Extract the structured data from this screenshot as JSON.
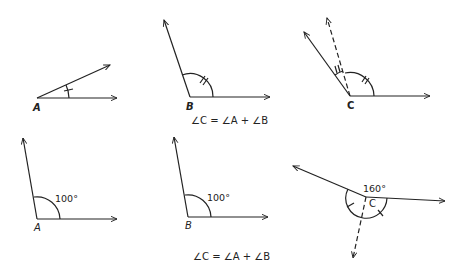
{
  "figure": {
    "top_row": {
      "angle_a": {
        "vertex_label": "A",
        "marks": "single-tick"
      },
      "angle_b": {
        "vertex_label": "B",
        "marks": "double-tick"
      },
      "angle_c": {
        "vertex_label": "C",
        "marks": "single-and-double-tick",
        "construction": "dashed ray"
      },
      "equation": "∠C = ∠A + ∠B"
    },
    "bottom_row": {
      "angle_a": {
        "vertex_label": "A",
        "measure": "100°"
      },
      "angle_b": {
        "vertex_label": "B",
        "measure": "100°"
      },
      "angle_c": {
        "vertex_label": "C",
        "measure": "160°",
        "construction": "dashed ray"
      },
      "equation": "∠C = ∠A + ∠B"
    },
    "colors": {
      "stroke": "#222222",
      "background": "#ffffff"
    }
  }
}
